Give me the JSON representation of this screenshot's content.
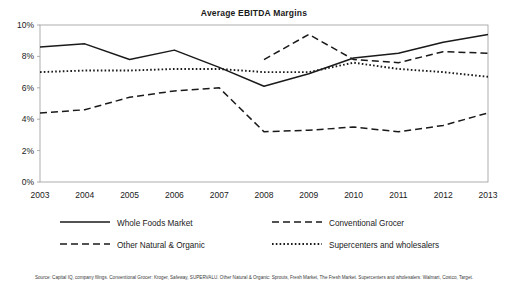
{
  "chart_data": {
    "type": "line",
    "title": "Average EBITDA Margins",
    "xlabel": "",
    "ylabel": "",
    "x": [
      "2003",
      "2004",
      "2005",
      "2006",
      "2007",
      "2008",
      "2009",
      "2010",
      "2011",
      "2012",
      "2013"
    ],
    "ytick_labels": [
      "0%",
      "2%",
      "4%",
      "6%",
      "8%",
      "10%"
    ],
    "ytick_values": [
      0,
      2,
      4,
      6,
      8,
      10
    ],
    "ylim": [
      0,
      10
    ],
    "grid": false,
    "legend_position": "bottom",
    "series": [
      {
        "name": "Whole Foods Market",
        "style": "solid",
        "color": "#1a1a1a",
        "values": [
          8.6,
          8.8,
          7.8,
          8.4,
          7.3,
          6.1,
          6.9,
          7.9,
          8.2,
          8.9,
          9.4
        ]
      },
      {
        "name": "Conventional Grocer",
        "style": "dashed",
        "color": "#1a1a1a",
        "values": [
          null,
          null,
          null,
          null,
          null,
          7.8,
          9.4,
          7.8,
          7.6,
          8.3,
          8.2
        ]
      },
      {
        "name": "Other Natural & Organic",
        "style": "dashed",
        "color": "#1a1a1a",
        "values": [
          4.4,
          4.6,
          5.4,
          5.8,
          6.0,
          3.2,
          3.3,
          3.5,
          3.2,
          3.6,
          4.4
        ]
      },
      {
        "name": "Supercenters and wholesalers",
        "style": "dotted",
        "color": "#1a1a1a",
        "values": [
          7.0,
          7.1,
          7.1,
          7.2,
          7.2,
          7.0,
          7.0,
          7.6,
          7.2,
          7.0,
          6.7
        ]
      }
    ]
  },
  "legend": {
    "items": [
      {
        "label": "Whole Foods Market",
        "style": "solid"
      },
      {
        "label": "Conventional Grocer",
        "style": "dashed"
      },
      {
        "label": "Other Natural & Organic",
        "style": "dashed"
      },
      {
        "label": "Supercenters and wholesalers",
        "style": "dotted"
      }
    ]
  },
  "footnote": "Source: Capital IQ, company filings. Conventional Grocer: Kroger, Safeway, SUPERVALU. Other Natural & Organic: Sprouts, Fresh Market, The Fresh Market. Supercenters and wholesalers: Walmart, Costco, Target."
}
